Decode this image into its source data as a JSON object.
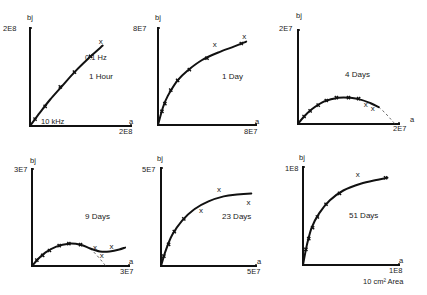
{
  "figure": {
    "footnote": "10 cm² Area",
    "ink_color": "#111111",
    "background": "#ffffff"
  },
  "chart_data": [
    {
      "type": "line",
      "title": "1 Hour",
      "xlabel": "a",
      "ylabel": "bj",
      "x_max_label": "2E8",
      "y_max_label": "2E8",
      "xlim": [
        0,
        200000000.0
      ],
      "ylim": [
        0,
        200000000.0
      ],
      "grid": false,
      "annotations": [
        {
          "text": "0.1 Hz",
          "at": "low-frequency end (top of curve)"
        },
        {
          "text": "10 kHz",
          "at": "high-frequency end (origin)"
        }
      ],
      "curve": [
        [
          0,
          0
        ],
        [
          0.1,
          0.14
        ],
        [
          0.2,
          0.27
        ],
        [
          0.32,
          0.41
        ],
        [
          0.45,
          0.56
        ],
        [
          0.6,
          0.71
        ],
        [
          0.72,
          0.82
        ]
      ],
      "ticks_on_curve": [
        [
          0.05,
          0.07
        ],
        [
          0.15,
          0.2
        ],
        [
          0.3,
          0.4
        ],
        [
          0.44,
          0.55
        ],
        [
          0.6,
          0.71
        ]
      ],
      "x_marks": [
        [
          0.7,
          0.86
        ]
      ],
      "dashed_extension": []
    },
    {
      "type": "line",
      "title": "1 Day",
      "xlabel": "a",
      "ylabel": "bj",
      "x_max_label": "8E7",
      "y_max_label": "8E7",
      "xlim": [
        0,
        80000000.0
      ],
      "ylim": [
        0,
        80000000.0
      ],
      "grid": false,
      "annotations": [],
      "curve": [
        [
          0,
          0
        ],
        [
          0.05,
          0.18
        ],
        [
          0.1,
          0.3
        ],
        [
          0.2,
          0.46
        ],
        [
          0.3,
          0.56
        ],
        [
          0.45,
          0.67
        ],
        [
          0.62,
          0.75
        ],
        [
          0.78,
          0.81
        ],
        [
          0.9,
          0.86
        ]
      ],
      "ticks_on_curve": [
        [
          0.04,
          0.14
        ],
        [
          0.07,
          0.22
        ],
        [
          0.13,
          0.36
        ],
        [
          0.2,
          0.46
        ],
        [
          0.32,
          0.57
        ],
        [
          0.5,
          0.69
        ],
        [
          0.85,
          0.84
        ]
      ],
      "x_marks": [
        [
          0.58,
          0.82
        ],
        [
          0.88,
          0.91
        ]
      ],
      "dashed_extension": []
    },
    {
      "type": "line",
      "title": "4 Days",
      "xlabel": "a",
      "ylabel": "bj",
      "x_max_label": "2E7",
      "y_max_label": "2E7",
      "xlim": [
        0,
        20000000.0
      ],
      "ylim": [
        0,
        20000000.0
      ],
      "grid": false,
      "annotations": [],
      "curve": [
        [
          0,
          0
        ],
        [
          0.06,
          0.08
        ],
        [
          0.14,
          0.16
        ],
        [
          0.26,
          0.24
        ],
        [
          0.4,
          0.28
        ],
        [
          0.52,
          0.28
        ],
        [
          0.62,
          0.26
        ],
        [
          0.72,
          0.22
        ],
        [
          0.8,
          0.18
        ]
      ],
      "ticks_on_curve": [
        [
          0.06,
          0.08
        ],
        [
          0.12,
          0.14
        ],
        [
          0.2,
          0.2
        ],
        [
          0.28,
          0.25
        ],
        [
          0.38,
          0.28
        ],
        [
          0.5,
          0.28
        ],
        [
          0.6,
          0.27
        ]
      ],
      "x_marks": [
        [
          0.67,
          0.2
        ],
        [
          0.74,
          0.16
        ]
      ],
      "dashed_extension": [
        [
          0.8,
          0.18
        ],
        [
          0.86,
          0.12
        ],
        [
          0.92,
          0.05
        ],
        [
          0.96,
          0
        ]
      ]
    },
    {
      "type": "line",
      "title": "9 Days",
      "xlabel": "a",
      "ylabel": "bj",
      "x_max_label": "3E7",
      "y_max_label": "3E7",
      "xlim": [
        0,
        30000000.0
      ],
      "ylim": [
        0,
        30000000.0
      ],
      "grid": false,
      "annotations": [],
      "curve": [
        [
          0,
          0
        ],
        [
          0.06,
          0.07
        ],
        [
          0.14,
          0.14
        ],
        [
          0.25,
          0.2
        ],
        [
          0.38,
          0.23
        ],
        [
          0.5,
          0.22
        ],
        [
          0.6,
          0.18
        ],
        [
          0.7,
          0.15
        ],
        [
          0.8,
          0.15
        ],
        [
          0.9,
          0.17
        ],
        [
          0.96,
          0.19
        ]
      ],
      "ticks_on_curve": [
        [
          0.05,
          0.06
        ],
        [
          0.11,
          0.11
        ],
        [
          0.18,
          0.16
        ],
        [
          0.28,
          0.21
        ],
        [
          0.38,
          0.23
        ],
        [
          0.5,
          0.22
        ]
      ],
      "x_marks": [
        [
          0.65,
          0.19
        ],
        [
          0.82,
          0.2
        ],
        [
          0.72,
          0.1
        ]
      ],
      "dashed_extension": [
        [
          0.6,
          0.18
        ],
        [
          0.66,
          0.12
        ],
        [
          0.72,
          0.05
        ],
        [
          0.76,
          0
        ]
      ]
    },
    {
      "type": "line",
      "title": "23 Days",
      "xlabel": "a",
      "ylabel": "bj",
      "x_max_label": "5E7",
      "y_max_label": "5E7",
      "xlim": [
        0,
        50000000.0
      ],
      "ylim": [
        0,
        50000000.0
      ],
      "grid": false,
      "annotations": [],
      "curve": [
        [
          0,
          0
        ],
        [
          0.05,
          0.16
        ],
        [
          0.12,
          0.32
        ],
        [
          0.22,
          0.46
        ],
        [
          0.35,
          0.58
        ],
        [
          0.5,
          0.66
        ],
        [
          0.66,
          0.71
        ],
        [
          0.8,
          0.73
        ],
        [
          0.95,
          0.74
        ]
      ],
      "ticks_on_curve": [
        [
          0.03,
          0.1
        ],
        [
          0.08,
          0.22
        ],
        [
          0.14,
          0.35
        ],
        [
          0.24,
          0.48
        ]
      ],
      "x_marks": [
        [
          0.42,
          0.56
        ],
        [
          0.61,
          0.78
        ],
        [
          0.92,
          0.64
        ]
      ],
      "dashed_extension": []
    },
    {
      "type": "line",
      "title": "51 Days",
      "xlabel": "a",
      "ylabel": "bj",
      "x_max_label": "1E8",
      "y_max_label": "1E8",
      "xlim": [
        0,
        100000000.0
      ],
      "ylim": [
        0,
        100000000.0
      ],
      "grid": false,
      "annotations": [],
      "curve": [
        [
          0,
          0
        ],
        [
          0.04,
          0.2
        ],
        [
          0.09,
          0.38
        ],
        [
          0.17,
          0.53
        ],
        [
          0.28,
          0.66
        ],
        [
          0.42,
          0.76
        ],
        [
          0.6,
          0.83
        ],
        [
          0.78,
          0.87
        ],
        [
          0.88,
          0.89
        ]
      ],
      "ticks_on_curve": [
        [
          0.03,
          0.16
        ],
        [
          0.06,
          0.27
        ],
        [
          0.1,
          0.38
        ],
        [
          0.15,
          0.49
        ],
        [
          0.24,
          0.62
        ],
        [
          0.38,
          0.73
        ],
        [
          0.86,
          0.89
        ]
      ],
      "x_marks": [
        [
          0.57,
          0.92
        ]
      ],
      "dashed_extension": []
    }
  ]
}
